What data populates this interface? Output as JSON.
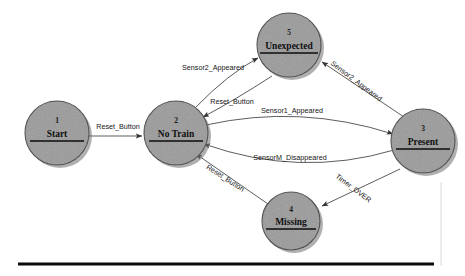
{
  "diagram": {
    "type": "state-transition-diagram",
    "background_color": "#ffffff",
    "node_fill_color": "#9a9a9a",
    "node_stroke_color": "#3b3b3b",
    "edge_color": "#4a4a4a",
    "label_color": "#151515"
  },
  "states": [
    {
      "id": "1",
      "number": "1",
      "name": "Start",
      "cx": 57,
      "cy": 133,
      "r": 32
    },
    {
      "id": "2",
      "number": "2",
      "name": "No Train",
      "cx": 176,
      "cy": 133,
      "r": 32
    },
    {
      "id": "5",
      "number": "5",
      "name": "Unexpected",
      "cx": 289,
      "cy": 45,
      "r": 32
    },
    {
      "id": "3",
      "number": "3",
      "name": "Present",
      "cx": 423,
      "cy": 141,
      "r": 32
    },
    {
      "id": "4",
      "number": "4",
      "name": "Missing",
      "cx": 291,
      "cy": 221,
      "r": 29
    }
  ],
  "transitions": [
    {
      "id": "t1",
      "from": "1",
      "to": "2",
      "label": "Reset_Button",
      "label_x": 118,
      "label_y": 129,
      "rotation": 0
    },
    {
      "id": "t2",
      "from": "2",
      "to": "5",
      "label": "Sensor2_Appeared",
      "label_x": 213,
      "label_y": 70,
      "rotation": 0
    },
    {
      "id": "t3",
      "from": "5",
      "to": "2",
      "label": "Reset_Button",
      "label_x": 232,
      "label_y": 104,
      "rotation": 0
    },
    {
      "id": "t4",
      "from": "3",
      "to": "5",
      "label": "Sensor2_Appeared",
      "label_x": 355,
      "label_y": 83,
      "rotation": 37
    },
    {
      "id": "t5",
      "from": "2",
      "to": "3",
      "label": "Sensor1_Appeared",
      "label_x": 292,
      "label_y": 113,
      "rotation": 0
    },
    {
      "id": "t6",
      "from": "3",
      "to": "2",
      "label": "SensorM_Disappeared",
      "label_x": 290,
      "label_y": 160,
      "rotation": 0
    },
    {
      "id": "t7",
      "from": "4",
      "to": "2",
      "label": "Reset_Button",
      "label_x": 224,
      "label_y": 180,
      "rotation": 33
    },
    {
      "id": "t8",
      "from": "3",
      "to": "4",
      "label": "Timer_OVER",
      "label_x": 352,
      "label_y": 190,
      "rotation": 37
    }
  ],
  "decorations": {
    "bottom_rule": {
      "x1": 18,
      "y1": 264,
      "x2": 434,
      "y2": 264
    },
    "right_edge_rule": {
      "x1": 441,
      "y1": 182,
      "x2": 441,
      "y2": 266
    }
  }
}
